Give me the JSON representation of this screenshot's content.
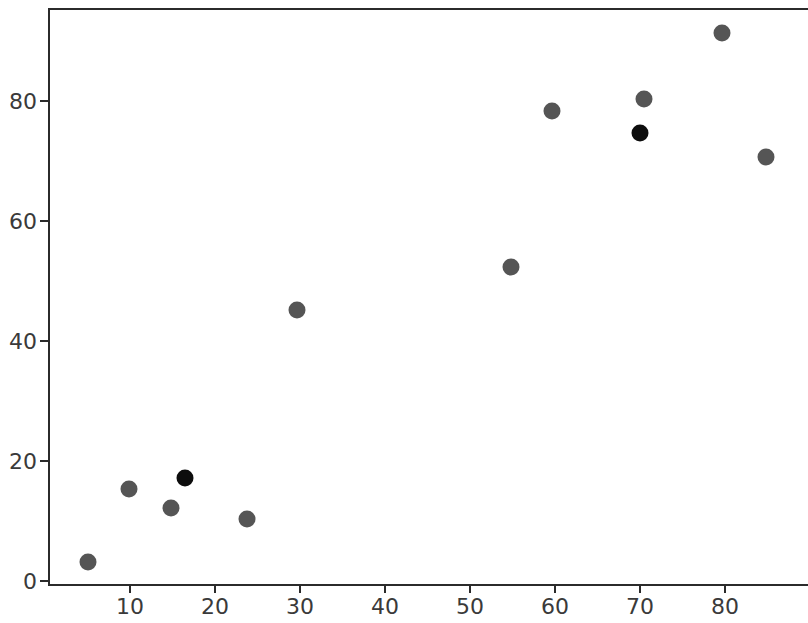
{
  "chart_data": {
    "type": "scatter",
    "title": "",
    "xlabel": "",
    "ylabel": "",
    "xlim": [
      0,
      88
    ],
    "ylim": [
      -1,
      96
    ],
    "grid": false,
    "legend": "none",
    "xticks": [
      10,
      20,
      30,
      40,
      50,
      60,
      70,
      80
    ],
    "yticks": [
      0,
      20,
      40,
      60,
      80
    ],
    "xtick_labels": [
      "10",
      "20",
      "30",
      "40",
      "50",
      "60",
      "70",
      "80"
    ],
    "ytick_labels": [
      "0",
      "20",
      "40",
      "60",
      "80"
    ],
    "marker_size_px": 17,
    "series": [
      {
        "name": "points",
        "color": "#555555",
        "points": [
          {
            "x": 5.0,
            "y": 3.2,
            "color": "#555555"
          },
          {
            "x": 9.9,
            "y": 15.3,
            "color": "#555555"
          },
          {
            "x": 14.8,
            "y": 12.2,
            "color": "#555555"
          },
          {
            "x": 16.5,
            "y": 17.2,
            "color": "#0d0d0d"
          },
          {
            "x": 23.8,
            "y": 10.3,
            "color": "#555555"
          },
          {
            "x": 29.6,
            "y": 45.1,
            "color": "#555555"
          },
          {
            "x": 54.8,
            "y": 52.3,
            "color": "#555555"
          },
          {
            "x": 59.7,
            "y": 78.4,
            "color": "#555555"
          },
          {
            "x": 70.0,
            "y": 74.7,
            "color": "#0d0d0d"
          },
          {
            "x": 70.5,
            "y": 80.4,
            "color": "#555555"
          },
          {
            "x": 79.6,
            "y": 91.4,
            "color": "#555555"
          },
          {
            "x": 84.8,
            "y": 70.6,
            "color": "#555555"
          }
        ]
      }
    ],
    "colors": {
      "marker_default": "#555555",
      "marker_highlight": "#0d0d0d",
      "axis": "#2b2b2b",
      "tick_label": "#3a3a3a",
      "background": "#ffffff"
    }
  }
}
